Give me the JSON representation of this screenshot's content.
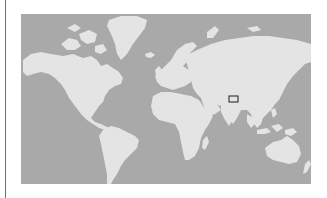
{
  "map": {
    "type": "world-map",
    "projection": "mercator",
    "colors": {
      "ocean": "#a9a9a9",
      "land": "#e4e4e4",
      "highlight_stroke": "#1e1e1e",
      "border_rule": "#6f6f6f"
    },
    "highlight": {
      "label": "",
      "region": "Himalaya / Southern Tibet",
      "x": 208,
      "y": 82,
      "width": 9,
      "height": 6
    }
  }
}
